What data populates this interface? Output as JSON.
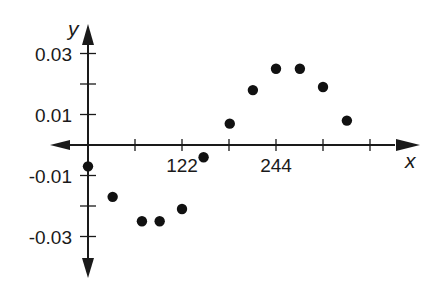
{
  "chart_data": {
    "type": "scatter",
    "title": "",
    "xlabel": "x",
    "ylabel": "y",
    "x_tick_labels": [
      "122",
      "244"
    ],
    "x_ticks": [
      61,
      122,
      183,
      244,
      305,
      366
    ],
    "y_tick_labels": [
      "0.03",
      "0.01",
      "-0.01",
      "-0.03"
    ],
    "y_ticks": [
      0.03,
      0.02,
      0.01,
      -0.01,
      -0.02,
      -0.03
    ],
    "xlim": [
      -50,
      420
    ],
    "ylim": [
      -0.042,
      0.042
    ],
    "grid": false,
    "legend": null,
    "series": [
      {
        "name": "data",
        "x": [
          0,
          32,
          70,
          93,
          122,
          150,
          184,
          214,
          244,
          275,
          305,
          336
        ],
        "y": [
          -0.007,
          -0.017,
          -0.025,
          -0.025,
          -0.021,
          -0.004,
          0.007,
          0.018,
          0.025,
          0.025,
          0.019,
          0.008
        ]
      }
    ],
    "colors": {
      "axis": "#1a1a1a",
      "points": "#111111",
      "background": "#ffffff"
    }
  }
}
